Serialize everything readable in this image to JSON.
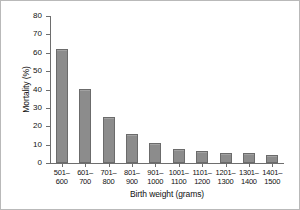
{
  "chart_data": {
    "type": "bar",
    "title": "",
    "xlabel": "Birth weight (grams)",
    "ylabel": "Mortality (%)",
    "categories": [
      "501– 600",
      "601– 700",
      "701– 800",
      "801– 900",
      "901– 1000",
      "1001– 1100",
      "1101– 1200",
      "1201– 1300",
      "1301– 1400",
      "1401– 1500"
    ],
    "category_lines": [
      [
        "501–",
        "600"
      ],
      [
        "601–",
        "700"
      ],
      [
        "701–",
        "800"
      ],
      [
        "801–",
        "900"
      ],
      [
        "901–",
        "1000"
      ],
      [
        "1001–",
        "1100"
      ],
      [
        "1101–",
        "1200"
      ],
      [
        "1201–",
        "1300"
      ],
      [
        "1301–",
        "1400"
      ],
      [
        "1401–",
        "1500"
      ]
    ],
    "values": [
      61.8,
      40.3,
      25.2,
      15.6,
      10.8,
      7.6,
      6.8,
      5.6,
      5.7,
      4.5
    ],
    "ylim": [
      0,
      80
    ],
    "ytick_values": [
      0,
      10,
      20,
      30,
      40,
      50,
      60,
      70,
      80
    ],
    "ytick_labels": [
      "0",
      "10",
      "20",
      "30",
      "40",
      "50",
      "60",
      "70",
      "80"
    ],
    "grid": false,
    "legend": null,
    "bar_color": "#8c8c8c",
    "bar_edge_color": "#6b6b6b",
    "axis_color": "#6e6e6e",
    "background_color": "#ffffff",
    "frame_color": "#b9b9b9"
  }
}
